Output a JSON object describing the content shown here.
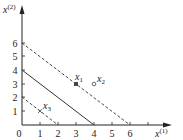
{
  "axes": {
    "x_label": "x",
    "x_sup": "(1)",
    "y_label": "x",
    "y_sup": "(2)",
    "x_ticks": [
      "0",
      "1",
      "2",
      "3",
      "4",
      "5",
      "6"
    ],
    "y_ticks": [
      "1",
      "2",
      "3",
      "4",
      "5",
      "6"
    ]
  },
  "lines": [
    {
      "name": "line-x1-plus-x2-eq-6",
      "style": "dashed",
      "from": [
        0,
        6
      ],
      "to": [
        6,
        0
      ]
    },
    {
      "name": "line-x1-plus-x2-eq-4",
      "style": "solid",
      "from": [
        0,
        4
      ],
      "to": [
        4,
        0
      ]
    },
    {
      "name": "line-x1-plus-x2-eq-2",
      "style": "dashed",
      "from": [
        0,
        2
      ],
      "to": [
        2,
        0
      ]
    }
  ],
  "points": [
    {
      "label": "x",
      "sub": "1",
      "coords": [
        3,
        3
      ],
      "marker": "filled-square"
    },
    {
      "label": "x",
      "sub": "2",
      "coords": [
        4,
        3
      ],
      "marker": "open-circle"
    },
    {
      "label": "x",
      "sub": "3",
      "coords": [
        1,
        1
      ],
      "marker": "cross"
    }
  ]
}
